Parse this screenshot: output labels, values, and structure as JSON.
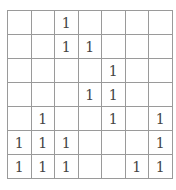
{
  "grid": {
    "rows": [
      [
        "",
        "",
        "1",
        "",
        "",
        "",
        ""
      ],
      [
        "",
        "",
        "1",
        "1",
        "",
        "",
        ""
      ],
      [
        "",
        "",
        "",
        "",
        "1",
        "",
        ""
      ],
      [
        "",
        "",
        "",
        "1",
        "1",
        "",
        ""
      ],
      [
        "",
        "1",
        "",
        "",
        "1",
        "",
        "1"
      ],
      [
        "1",
        "1",
        "1",
        "",
        "",
        "",
        "1"
      ],
      [
        "1",
        "1",
        "1",
        "",
        "",
        "1",
        "1"
      ]
    ]
  }
}
